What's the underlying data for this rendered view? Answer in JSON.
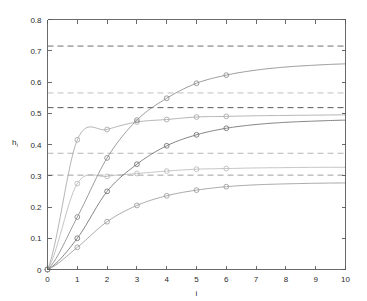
{
  "figure": {
    "background": "#ffffff",
    "axis_color": "#5a5a5a",
    "text_color": "#2b2b2b"
  },
  "chart_data": {
    "type": "line",
    "title": "",
    "subtitle": "",
    "xlabel": "i",
    "ylabel": "h",
    "ylabel_subscript": "i",
    "xlim": [
      0,
      10
    ],
    "ylim": [
      0,
      0.8
    ],
    "xticks": [
      0,
      1,
      2,
      3,
      4,
      5,
      6,
      7,
      8,
      9,
      10
    ],
    "xtick_labels": [
      "0",
      "1",
      "2",
      "3",
      "4",
      "5",
      "6",
      "7",
      "8",
      "9",
      "10"
    ],
    "yticks": [
      0,
      0.1,
      0.2,
      0.3,
      0.4,
      0.5,
      0.6,
      0.7,
      0.8
    ],
    "ytick_labels": [
      "0",
      "0.1",
      "0.2",
      "0.3",
      "0.4",
      "0.5",
      "0.6",
      "0.7",
      "0.8"
    ],
    "grid": false,
    "legend": null,
    "legend_position": "none",
    "marker": "circle",
    "marker_x_values": [
      0,
      1,
      2,
      3,
      4,
      5,
      6
    ],
    "series": [
      {
        "name": "curve-1",
        "color": "#b9b9b9",
        "asymptote": 0.302,
        "x": [
          0,
          1,
          2,
          3,
          4,
          5,
          6,
          7,
          8,
          9,
          10
        ],
        "values": [
          0.0,
          0.275,
          0.298,
          0.307,
          0.315,
          0.321,
          0.323,
          0.325,
          0.326,
          0.327,
          0.327
        ],
        "marker_values": [
          0.0,
          0.275,
          0.298,
          0.307,
          0.315,
          0.321,
          0.323
        ]
      },
      {
        "name": "curve-2",
        "color": "#a8a8a8",
        "asymptote": 0.372,
        "x": [
          0,
          1,
          2,
          3,
          4,
          5,
          6,
          7,
          8,
          9,
          10
        ],
        "values": [
          0.0,
          0.415,
          0.448,
          0.472,
          0.48,
          0.488,
          0.49,
          0.492,
          0.493,
          0.494,
          0.495
        ],
        "marker_values": [
          0.0,
          0.415,
          0.448,
          0.472,
          0.48,
          0.488,
          0.49
        ]
      },
      {
        "name": "curve-3",
        "color": "#8a8a8a",
        "asymptote": 0.518,
        "x": [
          0,
          1,
          2,
          3,
          4,
          5,
          6,
          7,
          8,
          9,
          10
        ],
        "values": [
          0.0,
          0.168,
          0.357,
          0.478,
          0.548,
          0.596,
          0.622,
          0.638,
          0.648,
          0.654,
          0.658
        ],
        "marker_values": [
          0.0,
          0.168,
          0.357,
          0.478,
          0.548,
          0.596,
          0.622
        ]
      },
      {
        "name": "curve-4",
        "color": "#6e6e6e",
        "asymptote": 0.565,
        "x": [
          0,
          1,
          2,
          3,
          4,
          5,
          6,
          7,
          8,
          9,
          10
        ],
        "values": [
          0.0,
          0.1,
          0.25,
          0.337,
          0.396,
          0.431,
          0.452,
          0.464,
          0.471,
          0.475,
          0.478
        ],
        "marker_values": [
          0.0,
          0.1,
          0.25,
          0.337,
          0.396,
          0.431,
          0.452
        ]
      },
      {
        "name": "curve-5",
        "color": "#999999",
        "asymptote": 0.715,
        "x": [
          0,
          1,
          2,
          3,
          4,
          5,
          6,
          7,
          8,
          9,
          10
        ],
        "values": [
          0.0,
          0.071,
          0.153,
          0.205,
          0.236,
          0.254,
          0.265,
          0.271,
          0.274,
          0.276,
          0.277
        ],
        "marker_values": [
          0.0,
          0.071,
          0.153,
          0.205,
          0.236,
          0.254,
          0.265
        ]
      }
    ],
    "reference_lines": [
      {
        "name": "ref-line-1",
        "value": 0.715,
        "color": "#6f6f6f",
        "style": "dashed"
      },
      {
        "name": "ref-line-2",
        "value": 0.565,
        "color": "#c0c0c0",
        "style": "dashed"
      },
      {
        "name": "ref-line-3",
        "value": 0.518,
        "color": "#5a5a5a",
        "style": "dashed"
      },
      {
        "name": "ref-line-4",
        "value": 0.372,
        "color": "#b5b5b5",
        "style": "dashed"
      },
      {
        "name": "ref-line-5",
        "value": 0.302,
        "color": "#a0a0a0",
        "style": "dashed"
      }
    ]
  }
}
